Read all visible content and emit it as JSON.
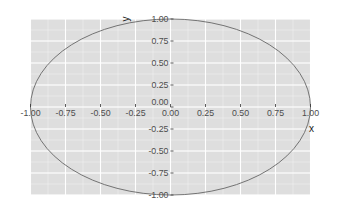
{
  "chart_data": {
    "type": "line",
    "title": "",
    "xlabel": "x",
    "ylabel": "y",
    "xlim": [
      -1,
      1
    ],
    "ylim": [
      -1,
      1
    ],
    "grid": true,
    "legend": null,
    "x_ticks": [
      "-1.00",
      "-0.75",
      "-0.50",
      "-0.25",
      "0.00",
      "0.25",
      "0.50",
      "0.75",
      "1.00"
    ],
    "y_ticks": [
      "1.00",
      "0.75",
      "0.50",
      "0.25",
      "0.00",
      "-0.25",
      "-0.50",
      "-0.75",
      "-1.00"
    ],
    "x_tick_values": [
      -1,
      -0.75,
      -0.5,
      -0.25,
      0,
      0.25,
      0.5,
      0.75,
      1
    ],
    "y_tick_values": [
      1,
      0.75,
      0.5,
      0.25,
      0,
      -0.25,
      -0.5,
      -0.75,
      -1
    ],
    "series": [
      {
        "name": "unit circle",
        "shape": "circle",
        "center": [
          0,
          0
        ],
        "radius": 1,
        "x": [
          1,
          0.7071,
          0,
          -0.7071,
          -1,
          -0.7071,
          0,
          0.7071,
          1
        ],
        "y": [
          0,
          0.7071,
          1,
          0.7071,
          0,
          -0.7071,
          -1,
          -0.7071,
          0
        ]
      }
    ],
    "axes_position": "centered at origin"
  },
  "colors": {
    "panel_background": "#dedede",
    "grid": "#ffffff",
    "curve": "#666666",
    "tick_text": "#4d4d4d",
    "tick_mark": "#333333"
  }
}
